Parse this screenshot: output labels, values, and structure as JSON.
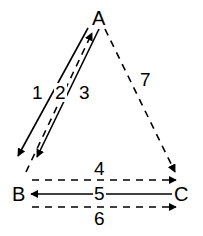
{
  "figure": {
    "type": "directed-graph-diagram",
    "shape": "triangle",
    "background_color": "#ffffff",
    "stroke_color": "#000000",
    "width": 203,
    "height": 236
  },
  "vertices": [
    {
      "id": "A",
      "label": "A",
      "x": 98,
      "y": 18,
      "name": "vertex-a"
    },
    {
      "id": "B",
      "label": "B",
      "x": 14,
      "y": 186,
      "name": "vertex-b"
    },
    {
      "id": "C",
      "label": "C",
      "x": 174,
      "y": 186,
      "name": "vertex-c"
    }
  ],
  "edges": [
    {
      "id": "1",
      "label": "1",
      "from": "A",
      "to": "B",
      "style": "solid",
      "arrow": "end",
      "direction": "down-left",
      "label_x": 31,
      "label_y": 83
    },
    {
      "id": "2",
      "label": "2",
      "from": "B",
      "to": "A",
      "style": "dashed",
      "arrow": "end",
      "direction": "up-right",
      "label_x": 54,
      "label_y": 83
    },
    {
      "id": "3",
      "label": "3",
      "from": "A",
      "to": "B",
      "style": "solid",
      "arrow": "end",
      "direction": "down-left",
      "label_x": 78,
      "label_y": 83
    },
    {
      "id": "4",
      "label": "4",
      "from": "B",
      "to": "C",
      "style": "dashed",
      "arrow": "end",
      "direction": "right",
      "label_x": 96,
      "label_y": 160
    },
    {
      "id": "5",
      "label": "5",
      "from": "C",
      "to": "B",
      "style": "solid",
      "arrow": "end",
      "direction": "left",
      "label_x": 96,
      "label_y": 185
    },
    {
      "id": "6",
      "label": "6",
      "from": "B",
      "to": "C",
      "style": "dashed",
      "arrow": "end",
      "direction": "right",
      "label_x": 96,
      "label_y": 209
    },
    {
      "id": "7",
      "label": "7",
      "from": "A",
      "to": "C",
      "style": "dashed",
      "arrow": "end",
      "direction": "down-right",
      "label_x": 140,
      "label_y": 70
    }
  ]
}
